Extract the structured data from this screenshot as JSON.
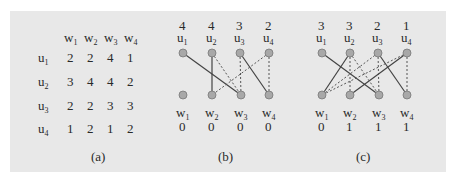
{
  "panel_a": {
    "caption": "(a)",
    "columns": [
      "w1",
      "w2",
      "w3",
      "w4"
    ],
    "rows": [
      {
        "label": "u1",
        "values": [
          "2",
          "2",
          "4",
          "1"
        ]
      },
      {
        "label": "u2",
        "values": [
          "3",
          "4",
          "4",
          "2"
        ]
      },
      {
        "label": "u3",
        "values": [
          "2",
          "2",
          "3",
          "3"
        ]
      },
      {
        "label": "u4",
        "values": [
          "1",
          "2",
          "1",
          "2"
        ]
      }
    ]
  },
  "panel_b": {
    "caption": "(b)",
    "top_nodes": [
      {
        "label": "u1",
        "value": "4"
      },
      {
        "label": "u2",
        "value": "4"
      },
      {
        "label": "u3",
        "value": "3"
      },
      {
        "label": "u4",
        "value": "2"
      }
    ],
    "bottom_nodes": [
      {
        "label": "w1",
        "value": "0"
      },
      {
        "label": "w2",
        "value": "0"
      },
      {
        "label": "w3",
        "value": "0"
      },
      {
        "label": "w4",
        "value": "0"
      }
    ],
    "solid_edges": [
      [
        "u1",
        "w3"
      ],
      [
        "u2",
        "w2"
      ],
      [
        "u3",
        "w4"
      ]
    ],
    "dashed_edges": [
      [
        "u2",
        "w3"
      ],
      [
        "u3",
        "w3"
      ],
      [
        "u4",
        "w2"
      ],
      [
        "u4",
        "w4"
      ]
    ]
  },
  "panel_c": {
    "caption": "(c)",
    "top_nodes": [
      {
        "label": "u1",
        "value": "3"
      },
      {
        "label": "u2",
        "value": "3"
      },
      {
        "label": "u3",
        "value": "2"
      },
      {
        "label": "u4",
        "value": "1"
      }
    ],
    "bottom_nodes": [
      {
        "label": "w1",
        "value": "0"
      },
      {
        "label": "w2",
        "value": "1"
      },
      {
        "label": "w3",
        "value": "1"
      },
      {
        "label": "w4",
        "value": "1"
      }
    ],
    "solid_edges": [
      [
        "u1",
        "w3"
      ],
      [
        "u2",
        "w1"
      ],
      [
        "u3",
        "w4"
      ],
      [
        "u4",
        "w2"
      ]
    ],
    "dashed_edges": [
      [
        "u2",
        "w2"
      ],
      [
        "u2",
        "w3"
      ],
      [
        "u3",
        "w1"
      ],
      [
        "u3",
        "w3"
      ],
      [
        "u4",
        "w1"
      ],
      [
        "u4",
        "w4"
      ]
    ]
  },
  "colors": {
    "background": "#e8e8e8",
    "node": "#a8a8a8",
    "line": "#444444"
  }
}
